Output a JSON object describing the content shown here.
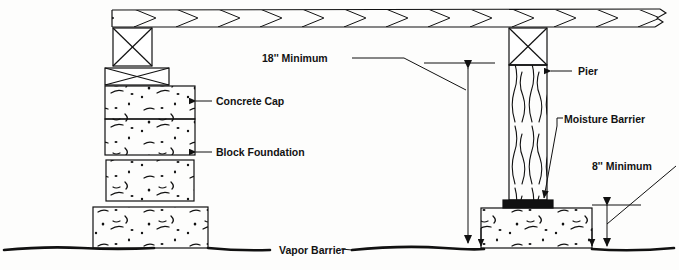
{
  "diagram": {
    "type": "architectural-section-drawing",
    "ink_color": "#111111",
    "paper_color": "#fdfdfc",
    "labels": {
      "dim_18": "18'' Minimum",
      "dim_8": "8'' Minimum",
      "concrete_cap": "Concrete Cap",
      "block_foundation": "Block Foundation",
      "pier": "Pier",
      "moisture_barrier": "Moisture Barrier",
      "vapor_barrier": "Vapor Barrier"
    },
    "components": {
      "girder": "floor-girder-with-chevron-hatch",
      "left_post": "x-braced-wood-post",
      "left_shim": "x-braced-shim-block",
      "left_stack": "stacked-concrete-blocks",
      "left_footing": "concrete-footing",
      "right_pier": "wood-grain-pier",
      "right_pier_cap": "x-braced-pier-top",
      "moisture_barrier_pad": "black-membrane-pad",
      "right_footing": "concrete-footing",
      "ground": "wavy-grade-line"
    },
    "dimensions": [
      {
        "name": "clearance",
        "value": "18''",
        "qualifier": "Minimum",
        "measures": "girder-underside-to-grade"
      },
      {
        "name": "footing-height",
        "value": "8''",
        "qualifier": "Minimum",
        "measures": "footing-top-to-grade"
      }
    ]
  }
}
